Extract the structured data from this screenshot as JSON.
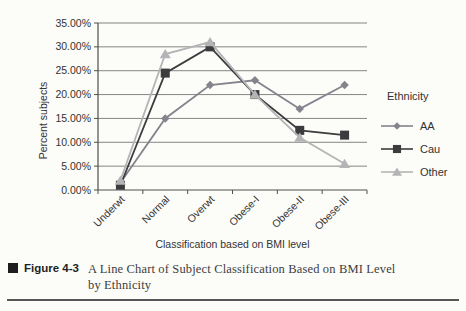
{
  "page": {
    "background": "#fcfcf9"
  },
  "chart_data": {
    "type": "line",
    "categories": [
      "Underwt",
      "Normal",
      "Overwt",
      "Obese-I",
      "Obese-II",
      "Obese-III"
    ],
    "series": [
      {
        "name": "AA",
        "marker": "diamond",
        "color": "#84848c",
        "values": [
          1.5,
          15,
          22,
          23,
          17,
          22
        ]
      },
      {
        "name": "Cau",
        "marker": "square",
        "color": "#3c3c3e",
        "values": [
          1,
          24.5,
          30,
          20,
          12.5,
          11.5
        ]
      },
      {
        "name": "Other",
        "marker": "triangle",
        "color": "#b4b4b6",
        "values": [
          2,
          28.5,
          31,
          20,
          11,
          5.5
        ]
      }
    ],
    "xlabel": "Classification based on BMI level",
    "ylabel": "Percent subjects",
    "ylim": [
      0,
      35
    ],
    "ytick_labels": [
      "35.00%",
      "30.00%",
      "25.00%",
      "20.00%",
      "15.00%",
      "10.00%",
      "5.00%",
      "0.00%"
    ],
    "grid": "horizontal-only",
    "legend_position": "right",
    "legend_title": "Ethnicity"
  },
  "caption": {
    "label": "Figure 4-3",
    "text_line1": "A Line Chart of Subject Classification Based on BMI Level",
    "text_line2": "by Ethnicity"
  },
  "style_colors": {
    "gridline": "#777777",
    "axis": "#4e4e4e",
    "tick_text": "#333333",
    "caption_text": "#3d3d3d",
    "rule": "#565656"
  }
}
